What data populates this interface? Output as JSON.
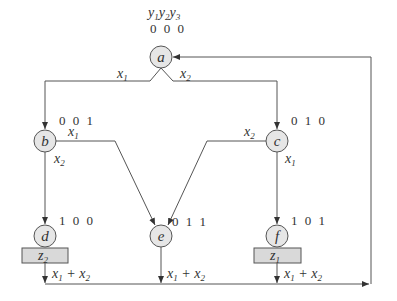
{
  "diagram": {
    "type": "ASM state graph (Moore machine)",
    "state_variable_header": {
      "y1": "y",
      "y2": "y",
      "y3": "y",
      "sub1": "1",
      "sub2": "2",
      "sub3": "3"
    },
    "nodes": [
      {
        "id": "a",
        "label": "a",
        "code": "0 0 0",
        "output": ""
      },
      {
        "id": "b",
        "label": "b",
        "code": "0 0 1",
        "output": ""
      },
      {
        "id": "c",
        "label": "c",
        "code": "0 1 0",
        "output": ""
      },
      {
        "id": "d",
        "label": "d",
        "code": "1 0 0",
        "output_var": "z",
        "output_sub": "2"
      },
      {
        "id": "e",
        "label": "e",
        "code": "0 1 1",
        "output": ""
      },
      {
        "id": "f",
        "label": "f",
        "code": "1 0 1",
        "output_var": "z",
        "output_sub": "1"
      }
    ],
    "edges": [
      {
        "from": "a",
        "to": "b",
        "cond_var": "x",
        "cond_sub": "1"
      },
      {
        "from": "a",
        "to": "c",
        "cond_var": "x",
        "cond_sub": "2"
      },
      {
        "from": "b",
        "to": "e",
        "cond_var": "x",
        "cond_sub": "1"
      },
      {
        "from": "b",
        "to": "d",
        "cond_var": "x",
        "cond_sub": "2"
      },
      {
        "from": "c",
        "to": "e",
        "cond_var": "x",
        "cond_sub": "2"
      },
      {
        "from": "c",
        "to": "f",
        "cond_var": "x",
        "cond_sub": "1"
      },
      {
        "from": "d",
        "to": "a",
        "cond": "x1 + x2"
      },
      {
        "from": "e",
        "to": "a",
        "cond": "x1 + x2"
      },
      {
        "from": "f",
        "to": "a",
        "cond": "x1 + x2"
      }
    ],
    "or_label": {
      "x": "x",
      "s1": "1",
      "plus": " + ",
      "s2": "2"
    }
  }
}
